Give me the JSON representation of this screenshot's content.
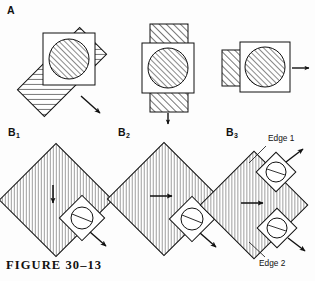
{
  "figure": {
    "caption": "FIGURE  30–13",
    "background_color": "#fdfdfd",
    "ink_color": "#111111",
    "hatch_color": "#555555"
  },
  "panels": [
    {
      "id": "A",
      "label": "A",
      "label_sub": "",
      "description": "Three sub-diagrams showing a hatched bar with a square window and a hatched circle; arrow indicates direction of motion.",
      "sub_panels": [
        {
          "id": "A1",
          "bar_orientation": "diagonal-45",
          "arrow_direction": "down-right",
          "window": "square",
          "circle": "hatched"
        },
        {
          "id": "A2",
          "bar_orientation": "vertical",
          "arrow_direction": "down",
          "window": "square",
          "circle": "hatched"
        },
        {
          "id": "A3",
          "bar_orientation": "horizontal",
          "arrow_direction": "right",
          "window": "square",
          "circle": "hatched"
        }
      ]
    },
    {
      "id": "B1",
      "label": "B",
      "label_sub": "1",
      "description": "Hatched diamond with one window square at lower-right edge; interior arrow points down; window arrow points down-right.",
      "interior_arrow_direction": "down",
      "windows": [
        {
          "position": "lower-right",
          "arrow_direction": "down-right",
          "edge_label": ""
        }
      ]
    },
    {
      "id": "B2",
      "label": "B",
      "label_sub": "2",
      "description": "Hatched diamond with one window square at lower-right edge; interior arrow points right; window arrow points down-right.",
      "interior_arrow_direction": "right",
      "windows": [
        {
          "position": "lower-right",
          "arrow_direction": "down-right",
          "edge_label": ""
        }
      ]
    },
    {
      "id": "B3",
      "label": "B",
      "label_sub": "3",
      "description": "Hatched diamond with two window squares on right edges; interior arrow points right; upper window arrow points up-right, lower window arrow points down-right.",
      "interior_arrow_direction": "right",
      "windows": [
        {
          "position": "upper-right",
          "arrow_direction": "up-right",
          "edge_label": "Edge 1"
        },
        {
          "position": "lower-right",
          "arrow_direction": "down-right",
          "edge_label": "Edge 2"
        }
      ]
    }
  ],
  "annotations": {
    "edge1": "Edge 1",
    "edge2": "Edge 2"
  }
}
